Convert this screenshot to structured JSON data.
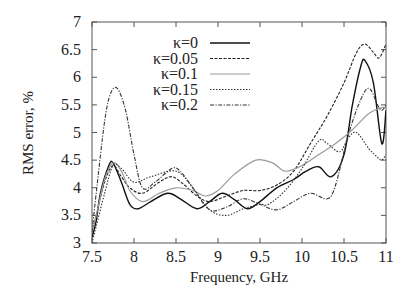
{
  "chart_data": {
    "type": "line",
    "title": "",
    "xlabel": "Frequency, GHz",
    "ylabel": "RMS error, %",
    "xlim": [
      7.5,
      11
    ],
    "ylim": [
      3,
      7
    ],
    "xticks": [
      7.5,
      8,
      8.5,
      9,
      9.5,
      10,
      10.5,
      11
    ],
    "xtick_labels": [
      "7.5",
      "8",
      "8.5",
      "9",
      "9.5",
      "10",
      "10.5",
      "11"
    ],
    "yticks": [
      3,
      3.5,
      4,
      4.5,
      5,
      5.5,
      6,
      6.5,
      7
    ],
    "ytick_labels": [
      "3",
      "3.5",
      "4",
      "4.5",
      "5",
      "5.5",
      "6",
      "6.5",
      "7"
    ],
    "grid": false,
    "legend_position": "upper-center-inside",
    "series": [
      {
        "name": "κ=0",
        "style": "solid",
        "color": "#111111",
        "x": [
          7.5,
          7.55,
          7.6,
          7.7,
          7.75,
          7.85,
          7.95,
          8.05,
          8.2,
          8.4,
          8.55,
          8.75,
          8.9,
          9.05,
          9.2,
          9.35,
          9.5,
          9.7,
          9.9,
          10.05,
          10.2,
          10.35,
          10.5,
          10.6,
          10.7,
          10.75,
          10.85,
          10.95,
          11.0
        ],
        "y": [
          3.1,
          3.4,
          3.9,
          4.4,
          4.45,
          4.1,
          3.7,
          3.62,
          3.75,
          3.9,
          3.8,
          3.62,
          3.75,
          3.9,
          3.78,
          3.62,
          3.75,
          4.0,
          4.15,
          4.3,
          4.38,
          4.2,
          4.6,
          5.5,
          6.2,
          6.3,
          5.9,
          4.8,
          5.4
        ]
      },
      {
        "name": "κ=0.05",
        "style": "dashed",
        "color": "#222222",
        "x": [
          7.5,
          7.55,
          7.65,
          7.75,
          7.85,
          7.95,
          8.1,
          8.3,
          8.45,
          8.6,
          8.75,
          8.9,
          9.1,
          9.3,
          9.5,
          9.7,
          9.9,
          10.1,
          10.3,
          10.5,
          10.65,
          10.75,
          10.85,
          10.92,
          11.0
        ],
        "y": [
          3.2,
          3.5,
          4.1,
          4.4,
          4.2,
          4.0,
          3.9,
          4.1,
          4.2,
          4.05,
          3.85,
          3.75,
          3.85,
          3.95,
          3.95,
          4.05,
          4.3,
          4.8,
          5.3,
          5.9,
          6.45,
          6.6,
          6.45,
          6.35,
          6.6
        ]
      },
      {
        "name": "κ=0.1",
        "style": "solid-gray",
        "color": "#9a9a9a",
        "x": [
          7.5,
          7.55,
          7.65,
          7.75,
          7.85,
          7.95,
          8.1,
          8.3,
          8.5,
          8.7,
          8.85,
          9.0,
          9.2,
          9.45,
          9.65,
          9.8,
          10.0,
          10.2,
          10.4,
          10.6,
          10.8,
          10.95,
          11.0
        ],
        "y": [
          3.2,
          3.5,
          4.15,
          4.45,
          4.3,
          3.95,
          3.75,
          3.9,
          4.0,
          3.95,
          3.85,
          3.95,
          4.25,
          4.5,
          4.45,
          4.3,
          4.4,
          4.6,
          4.8,
          5.05,
          5.35,
          5.45,
          5.45
        ]
      },
      {
        "name": "κ=0.15",
        "style": "dotted",
        "color": "#333333",
        "x": [
          7.5,
          7.55,
          7.65,
          7.75,
          7.85,
          8.0,
          8.2,
          8.5,
          8.7,
          8.9,
          9.1,
          9.3,
          9.5,
          9.6,
          9.8,
          10.0,
          10.2,
          10.3,
          10.45,
          10.55,
          10.65,
          10.8,
          10.9,
          10.95,
          11.0
        ],
        "y": [
          3.0,
          3.3,
          3.9,
          4.4,
          4.35,
          4.1,
          4.2,
          4.3,
          4.0,
          3.6,
          3.5,
          3.62,
          3.7,
          3.7,
          3.95,
          4.35,
          4.85,
          4.8,
          4.65,
          4.9,
          5.0,
          4.7,
          4.55,
          4.5,
          4.6
        ]
      },
      {
        "name": "κ=0.2",
        "style": "dash-dot",
        "color": "#333333",
        "x": [
          7.5,
          7.55,
          7.65,
          7.72,
          7.8,
          7.9,
          8.0,
          8.1,
          8.25,
          8.45,
          8.55,
          8.7,
          8.9,
          9.1,
          9.3,
          9.5,
          9.7,
          9.9,
          10.1,
          10.3,
          10.4,
          10.55,
          10.7,
          10.8,
          10.9,
          10.95,
          11.0
        ],
        "y": [
          3.2,
          3.9,
          5.2,
          5.7,
          5.8,
          5.4,
          4.6,
          4.0,
          4.1,
          4.35,
          4.3,
          4.0,
          3.6,
          3.65,
          3.8,
          3.7,
          3.6,
          3.75,
          3.9,
          3.8,
          4.05,
          4.95,
          5.6,
          5.8,
          5.5,
          5.4,
          5.5
        ]
      }
    ]
  }
}
